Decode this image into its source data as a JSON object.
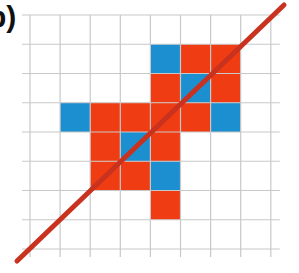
{
  "figure": {
    "panel_label": "b)",
    "grid": {
      "origin_x": 30,
      "origin_y": 15,
      "cell_w": 30.1,
      "cell_h": 29.25,
      "cols": 8,
      "rows": 8,
      "extend_left": 8,
      "extend_right": 9,
      "extend_top": 0,
      "extend_bottom": 8,
      "line_color": "#c8c8c8"
    },
    "colors": {
      "red": "#f03c12",
      "blue": "#1b8fd0",
      "diagonal": "#c8321e"
    },
    "cells": [
      {
        "row": 1,
        "col": 4,
        "color": "blue"
      },
      {
        "row": 1,
        "col": 5,
        "color": "red"
      },
      {
        "row": 1,
        "col": 6,
        "color": "red"
      },
      {
        "row": 2,
        "col": 4,
        "color": "red"
      },
      {
        "row": 2,
        "col": 5,
        "color": "blue"
      },
      {
        "row": 2,
        "col": 6,
        "color": "red"
      },
      {
        "row": 3,
        "col": 1,
        "color": "blue"
      },
      {
        "row": 3,
        "col": 2,
        "color": "red"
      },
      {
        "row": 3,
        "col": 3,
        "color": "red"
      },
      {
        "row": 3,
        "col": 4,
        "color": "red"
      },
      {
        "row": 3,
        "col": 5,
        "color": "red"
      },
      {
        "row": 3,
        "col": 6,
        "color": "blue"
      },
      {
        "row": 4,
        "col": 2,
        "color": "red"
      },
      {
        "row": 4,
        "col": 3,
        "color": "blue"
      },
      {
        "row": 4,
        "col": 4,
        "color": "red"
      },
      {
        "row": 5,
        "col": 2,
        "color": "red"
      },
      {
        "row": 5,
        "col": 3,
        "color": "red"
      },
      {
        "row": 5,
        "col": 4,
        "color": "blue"
      },
      {
        "row": 6,
        "col": 4,
        "color": "red"
      }
    ],
    "diagonal_line": {
      "x1": 17,
      "y1": 261,
      "x2": 284,
      "y2": 5,
      "width": 5
    }
  }
}
